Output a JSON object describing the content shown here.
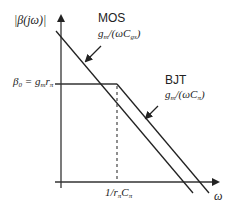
{
  "diagram": {
    "y_axis_label": "|β(jω)|",
    "x_axis_label": "ω",
    "plateau_label": {
      "lhs": "β",
      "lhs_sub": "0",
      "eq": " = g",
      "g_sub": "m",
      "r": "r",
      "r_sub": "π"
    },
    "corner_label": {
      "pre": "1/r",
      "r_sub": "π",
      "c": "C",
      "c_sub": "π"
    },
    "mos": {
      "name": "MOS",
      "g": "g",
      "g_sub": "m",
      "mid": "/(ωC",
      "c_sub": "gs",
      "close": ")"
    },
    "bjt": {
      "name": "BJT",
      "g": "g",
      "g_sub": "m",
      "mid": "/(ωC",
      "c_sub": "π",
      "close": ")"
    },
    "colors": {
      "line": "#222222",
      "axis": "#333333"
    }
  }
}
